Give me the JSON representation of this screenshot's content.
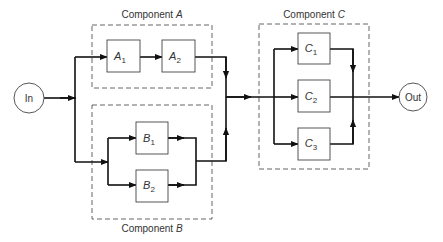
{
  "diagram": {
    "terminals": {
      "input": "In",
      "output": "Out"
    },
    "components": [
      {
        "id": "A",
        "label_prefix": "Component ",
        "label_var": "A",
        "configuration": "series",
        "blocks": [
          {
            "letter": "A",
            "index": "1"
          },
          {
            "letter": "A",
            "index": "2"
          }
        ]
      },
      {
        "id": "B",
        "label_prefix": "Component ",
        "label_var": "B",
        "configuration": "parallel",
        "blocks": [
          {
            "letter": "B",
            "index": "1"
          },
          {
            "letter": "B",
            "index": "2"
          }
        ]
      },
      {
        "id": "C",
        "label_prefix": "Component ",
        "label_var": "C",
        "configuration": "parallel",
        "blocks": [
          {
            "letter": "C",
            "index": "1"
          },
          {
            "letter": "C",
            "index": "2"
          },
          {
            "letter": "C",
            "index": "3"
          }
        ]
      }
    ],
    "connections": [
      "In → split(A, B)",
      "A1 → A2",
      "B1 ∥ B2",
      "merge(A, B) → split(C1, C2, C3)",
      "merge(C) → Out"
    ]
  }
}
